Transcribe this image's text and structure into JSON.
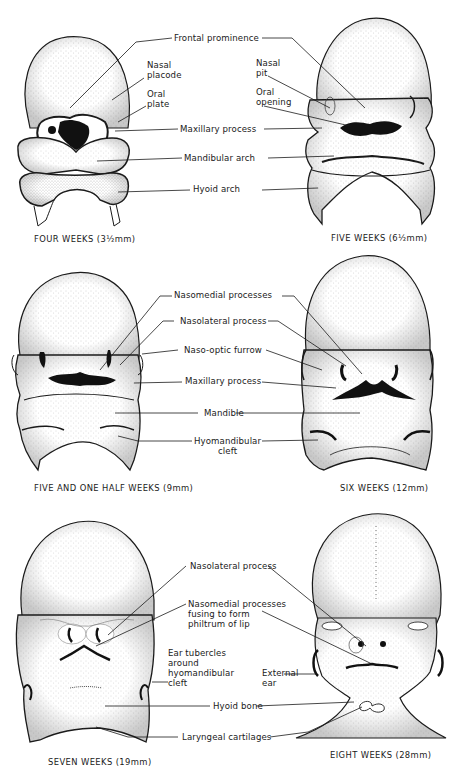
{
  "figure": {
    "colors": {
      "ink": "#1a1a1a",
      "background": "#ffffff",
      "stipple": "#555555"
    }
  },
  "panels": [
    {
      "id": "four-weeks",
      "caption": "FOUR WEEKS (3½mm)",
      "labels": [
        "Nasal\nplacode",
        "Oral\nplate"
      ]
    },
    {
      "id": "five-weeks",
      "caption": "FIVE WEEKS (6½mm)",
      "labels": [
        "Nasal\npit",
        "Oral\nopening"
      ]
    },
    {
      "id": "five-and-one-half-weeks",
      "caption": "FIVE AND ONE HALF WEEKS (9mm)",
      "labels": []
    },
    {
      "id": "six-weeks",
      "caption": "SIX WEEKS (12mm)",
      "labels": []
    },
    {
      "id": "seven-weeks",
      "caption": "SEVEN WEEKS (19mm)",
      "labels": [
        "Ear tubercles\naround\nhyomandibular\ncleft"
      ]
    },
    {
      "id": "eight-weeks",
      "caption": "EIGHT WEEKS (28mm)",
      "labels": [
        "External\near"
      ]
    }
  ],
  "shared_labels": {
    "row1": [
      "Frontal prominence",
      "Maxillary process",
      "Mandibular arch",
      "Hyoid arch"
    ],
    "row2": [
      "Nasomedial processes",
      "Nasolateral process",
      "Naso-optic furrow",
      "Maxillary process",
      "Mandible",
      "Hyomandibular\ncleft"
    ],
    "row3": [
      "Nasolateral process",
      "Nasomedial processes\nfusing to form\nphiltrum of lip",
      "Hyoid bone",
      "Laryngeal cartilages"
    ]
  }
}
